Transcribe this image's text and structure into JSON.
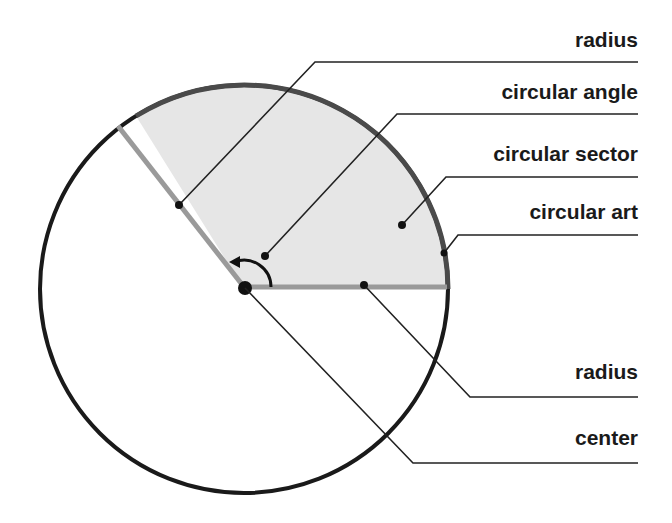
{
  "diagram": {
    "type": "circle-parts",
    "circle": {
      "cx": 244,
      "cy": 289,
      "r": 204
    },
    "sector": {
      "start_deg": 0,
      "end_deg": 122,
      "fill": "#e6e6e6"
    },
    "colors": {
      "outline": "#1a1a1a",
      "arc": "#444444",
      "radius_line": "#999999",
      "leader": "#222222"
    },
    "labels": [
      {
        "id": "radius-top",
        "text": "radius",
        "y": 30
      },
      {
        "id": "circular-angle",
        "text": "circular angle",
        "y": 82
      },
      {
        "id": "circular-sector",
        "text": "circular sector",
        "y": 144
      },
      {
        "id": "circular-arc",
        "text": "circular art",
        "y": 202
      },
      {
        "id": "radius-bottom",
        "text": "radius",
        "y": 362
      },
      {
        "id": "center",
        "text": "center",
        "y": 428
      }
    ]
  }
}
